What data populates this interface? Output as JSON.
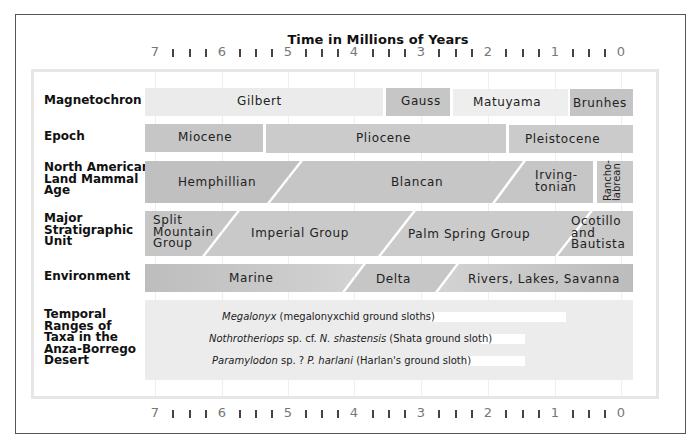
{
  "title": "Time in Millions of Years",
  "scale": {
    "ticks": [
      "7",
      "6",
      "5",
      "4",
      "3",
      "2",
      "1",
      "0"
    ],
    "minor_per_interval": 3
  },
  "rows": {
    "magnetochron": {
      "label": "Magnetochron",
      "segments": [
        {
          "name": "Gilbert",
          "start_ma": 7.0,
          "end_ma": 3.6
        },
        {
          "name": "Gauss",
          "start_ma": 3.6,
          "end_ma": 2.6
        },
        {
          "name": "Matuyama",
          "start_ma": 2.6,
          "end_ma": 0.78
        },
        {
          "name": "Brunhes",
          "start_ma": 0.78,
          "end_ma": 0.0
        }
      ]
    },
    "epoch": {
      "label": "Epoch",
      "segments": [
        {
          "name": "Miocene",
          "start_ma": 7.0,
          "end_ma": 5.3
        },
        {
          "name": "Pliocene",
          "start_ma": 5.3,
          "end_ma": 1.8
        },
        {
          "name": "Pleistocene",
          "start_ma": 1.8,
          "end_ma": 0.0
        }
      ]
    },
    "nalma": {
      "label": "North American Land Mammal Age",
      "label_lines": [
        "North American",
        "Land Mammal",
        "Age"
      ],
      "segments": [
        {
          "name": "Hemphillian"
        },
        {
          "name": "Blancan"
        },
        {
          "name": "Irving-tonian",
          "lines": [
            "Irving-",
            "tonian"
          ]
        },
        {
          "name": "Rancho-labrean",
          "lines": [
            "Rancho-",
            "labrean"
          ]
        }
      ]
    },
    "stratigraphic": {
      "label": "Major Stratigraphic Unit",
      "label_lines": [
        "Major",
        "Stratigraphic",
        "Unit"
      ],
      "segments": [
        {
          "name": "Split Mountain Group",
          "lines": [
            "Split",
            "Mountain",
            "Group"
          ]
        },
        {
          "name": "Imperial Group"
        },
        {
          "name": "Palm Spring Group"
        },
        {
          "name": "Ocotillo and Bautista",
          "lines": [
            "Ocotillo",
            "and",
            "Bautista"
          ]
        }
      ]
    },
    "environment": {
      "label": "Environment",
      "segments": [
        {
          "name": "Marine"
        },
        {
          "name": "Delta"
        },
        {
          "name": "Rivers, Lakes, Savanna"
        }
      ]
    },
    "taxa": {
      "label": "Temporal Ranges of Taxa in the Anza-Borrego Desert",
      "label_lines": [
        "Temporal",
        "Ranges of",
        "Taxa in the",
        "Anza-Borrego",
        "Desert"
      ],
      "items": [
        {
          "italic": "Megalonyx",
          "rest": " (megalonyxchid ground sloths)",
          "start_ma": 3.0,
          "end_ma": 1.0
        },
        {
          "italic": "Nothrotheriops",
          "mid": " sp. cf. ",
          "italic2": "N. shastensis",
          "rest": " (Shata ground sloth)",
          "start_ma": 2.0,
          "end_ma": 1.4
        },
        {
          "italic": "Paramylodon",
          "mid": " sp. ? ",
          "italic2": "P. harlani",
          "rest": " (Harlan's ground sloth)",
          "start_ma": 2.2,
          "end_ma": 1.4
        }
      ]
    }
  },
  "colors": {
    "light_band": "#e9e9e9",
    "mid_band": "#c9c9c9",
    "dark_band": "#b8b8b8",
    "taxa_bg": "#ececec",
    "range_bar": "#ffffff"
  }
}
